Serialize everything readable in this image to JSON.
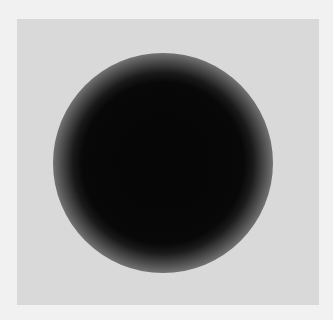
{
  "image": {
    "description": "Blurred dark circular spot on a light gray square",
    "colors": {
      "outer_border": "#f1f1f1",
      "background": "#d9d9d9",
      "spot_core": "#050505"
    }
  }
}
